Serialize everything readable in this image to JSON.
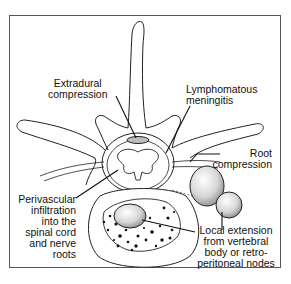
{
  "diagram": {
    "labels": {
      "extradural": [
        "Extradural",
        "compression"
      ],
      "lymphomatous": [
        "Lymphomatous",
        "meningitis"
      ],
      "root": [
        "Root",
        "compression"
      ],
      "perivascular": [
        "Perivascular",
        "infiltration",
        "into the",
        "spinal cord",
        "and nerve",
        "roots"
      ],
      "local": [
        "Local extension",
        "from vertebral",
        "body or retro-",
        "peritoneal nodes"
      ]
    },
    "colors": {
      "line": "#222222",
      "frame": "#555555",
      "node_fill": "#d8d8d8",
      "dots": "#111111"
    }
  }
}
